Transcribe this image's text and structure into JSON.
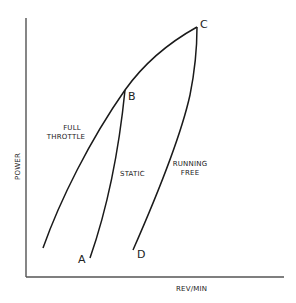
{
  "diagram": {
    "title": "",
    "axes": {
      "x_label": "REV/MIN",
      "y_label": "POWER",
      "color": "#444444"
    },
    "points": {
      "A": "A",
      "B": "B",
      "C": "C",
      "D": "D"
    },
    "curves": [
      {
        "id": "full-throttle",
        "label_line1": "FULL",
        "label_line2": "THROTTLE"
      },
      {
        "id": "static",
        "label_line1": "STATIC"
      },
      {
        "id": "running-free",
        "label_line1": "RUNNING",
        "label_line2": "FREE"
      }
    ],
    "line_color": "#1a1a1a"
  }
}
